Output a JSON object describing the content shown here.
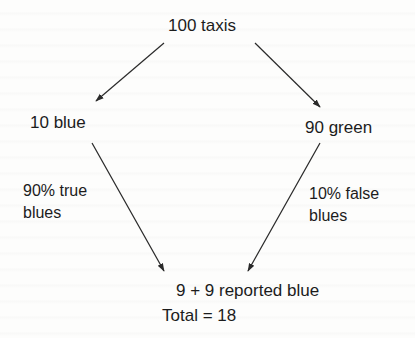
{
  "diagram": {
    "type": "probability-tree",
    "nodes": {
      "root": "100 taxis",
      "left": "10 blue",
      "right": "90 green",
      "result_line1": "9 + 9 reported blue",
      "result_line2": "Total = 18"
    },
    "edge_labels": {
      "left_line1": "90% true",
      "left_line2": "blues",
      "right_line1": "10% false",
      "right_line2": "blues"
    },
    "edges": [
      {
        "from": "100 taxis",
        "to": "10 blue",
        "arrow": true
      },
      {
        "from": "100 taxis",
        "to": "90 green",
        "arrow": true
      },
      {
        "from": "10 blue",
        "to": "9 + 9 reported blue",
        "label": "90% true blues",
        "arrow": true
      },
      {
        "from": "90 green",
        "to": "9 + 9 reported blue",
        "label": "10% false blues",
        "arrow": true
      }
    ],
    "colors": {
      "text": "#1c1c1c",
      "lines": "#2a2a2a",
      "background": "#fdfdfc"
    }
  }
}
